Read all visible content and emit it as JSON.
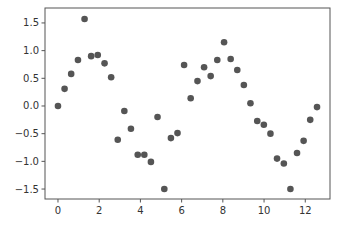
{
  "chart_data": {
    "type": "scatter",
    "title": "",
    "xlabel": "",
    "ylabel": "",
    "xlim": [
      -0.63,
      13.2
    ],
    "ylim": [
      -1.68,
      1.77
    ],
    "grid": false,
    "legend": null,
    "marker_color": "#555555",
    "x_ticks": [
      0,
      2,
      4,
      6,
      8,
      10,
      12
    ],
    "x_tick_labels": [
      "0",
      "2",
      "4",
      "6",
      "8",
      "10",
      "12"
    ],
    "y_ticks": [
      1.5,
      1.0,
      0.5,
      0.0,
      -0.5,
      -1.0,
      -1.5
    ],
    "y_tick_labels": [
      "1.5",
      "1.0",
      "0.5",
      "0.0",
      "−0.5",
      "−1.0",
      "−1.5"
    ],
    "x": [
      0.0,
      0.32,
      0.64,
      0.97,
      1.29,
      1.61,
      1.93,
      2.26,
      2.58,
      2.9,
      3.22,
      3.54,
      3.87,
      4.19,
      4.51,
      4.83,
      5.16,
      5.48,
      5.8,
      6.12,
      6.44,
      6.77,
      7.09,
      7.41,
      7.73,
      8.06,
      8.38,
      8.7,
      9.02,
      9.34,
      9.67,
      9.99,
      10.31,
      10.63,
      10.96,
      11.28,
      11.6,
      11.92,
      12.24,
      12.57
    ],
    "y": [
      0.0,
      0.31,
      0.58,
      0.83,
      1.57,
      0.9,
      0.92,
      0.77,
      0.52,
      -0.61,
      -0.09,
      -0.41,
      -0.88,
      -0.88,
      -1.01,
      -0.2,
      -1.5,
      -0.58,
      -0.49,
      0.74,
      0.14,
      0.45,
      0.7,
      0.54,
      0.83,
      1.15,
      0.85,
      0.65,
      0.38,
      0.05,
      -0.27,
      -0.34,
      -0.5,
      -0.95,
      -1.04,
      -1.5,
      -0.85,
      -0.63,
      -0.25,
      -0.02
    ]
  }
}
